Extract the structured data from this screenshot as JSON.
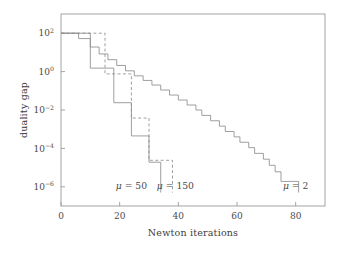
{
  "chart_data": {
    "type": "line",
    "title": "",
    "xlabel": "Newton iterations",
    "ylabel": "duality gap",
    "xlim": [
      0,
      90
    ],
    "ylim_log10": [
      -7,
      3
    ],
    "yscale": "log",
    "grid": false,
    "legend_position": "inline-annotations",
    "xticks": [
      0,
      20,
      40,
      60,
      80
    ],
    "xtick_labels": [
      "0",
      "20",
      "40",
      "60",
      "80"
    ],
    "yticks_log10": [
      2,
      0,
      -2,
      -4,
      -6
    ],
    "ytick_mantissa": [
      "10",
      "10",
      "10",
      "10",
      "10"
    ],
    "ytick_exponents": [
      "2",
      "0",
      "−2",
      "−4",
      "−6"
    ],
    "annotations": [
      {
        "text_mu": "μ",
        "text_rest": " = 50",
        "x": 24,
        "y_log10": -6.1
      },
      {
        "text_mu": "μ",
        "text_rest": " = 150",
        "x": 39,
        "y_log10": -6.1
      },
      {
        "text_mu": "μ",
        "text_rest": " = 2",
        "x": 80,
        "y_log10": -6.1
      }
    ],
    "series": [
      {
        "name": "mu = 50",
        "mu": 50,
        "style": "solid",
        "color": "#8e8e8e",
        "points_log10": [
          [
            0,
            2.0
          ],
          [
            6,
            2.0
          ],
          [
            6,
            1.72
          ],
          [
            10,
            1.72
          ],
          [
            10,
            0.18
          ],
          [
            14,
            0.18
          ],
          [
            14,
            0.18
          ],
          [
            18,
            0.18
          ],
          [
            18,
            -1.62
          ],
          [
            24,
            -1.62
          ],
          [
            24,
            -3.35
          ],
          [
            30,
            -3.35
          ],
          [
            30,
            -4.72
          ],
          [
            34,
            -4.72
          ],
          [
            34,
            -6.3
          ]
        ]
      },
      {
        "name": "mu = 150",
        "mu": 150,
        "style": "dashed",
        "color": "#8e8e8e",
        "points_log10": [
          [
            0,
            2.0
          ],
          [
            15,
            2.0
          ],
          [
            15,
            -0.12
          ],
          [
            24,
            -0.12
          ],
          [
            24,
            -2.42
          ],
          [
            30,
            -2.42
          ],
          [
            30,
            -4.62
          ],
          [
            38,
            -4.62
          ],
          [
            38,
            -6.3
          ]
        ]
      },
      {
        "name": "mu = 2",
        "mu": 2,
        "style": "solid",
        "color": "#8e8e8e",
        "points_log10": [
          [
            0,
            2.0
          ],
          [
            10,
            2.0
          ],
          [
            10,
            1.28
          ],
          [
            13,
            1.28
          ],
          [
            13,
            0.92
          ],
          [
            16,
            0.92
          ],
          [
            16,
            0.62
          ],
          [
            19,
            0.62
          ],
          [
            19,
            0.32
          ],
          [
            22,
            0.32
          ],
          [
            22,
            0.04
          ],
          [
            25,
            0.04
          ],
          [
            25,
            -0.22
          ],
          [
            28,
            -0.22
          ],
          [
            28,
            -0.46
          ],
          [
            31,
            -0.46
          ],
          [
            31,
            -0.7
          ],
          [
            34,
            -0.7
          ],
          [
            34,
            -0.96
          ],
          [
            37,
            -0.96
          ],
          [
            37,
            -1.22
          ],
          [
            40,
            -1.22
          ],
          [
            40,
            -1.48
          ],
          [
            43,
            -1.48
          ],
          [
            43,
            -1.74
          ],
          [
            46,
            -1.74
          ],
          [
            46,
            -2.0
          ],
          [
            48,
            -2.0
          ],
          [
            48,
            -2.28
          ],
          [
            51,
            -2.28
          ],
          [
            51,
            -2.56
          ],
          [
            54,
            -2.56
          ],
          [
            54,
            -2.84
          ],
          [
            56,
            -2.84
          ],
          [
            56,
            -3.12
          ],
          [
            59,
            -3.12
          ],
          [
            59,
            -3.4
          ],
          [
            61,
            -3.4
          ],
          [
            61,
            -3.68
          ],
          [
            64,
            -3.68
          ],
          [
            64,
            -3.96
          ],
          [
            66,
            -3.96
          ],
          [
            66,
            -4.26
          ],
          [
            69,
            -4.26
          ],
          [
            69,
            -4.56
          ],
          [
            71,
            -4.56
          ],
          [
            71,
            -4.88
          ],
          [
            73,
            -4.88
          ],
          [
            73,
            -5.22
          ],
          [
            75,
            -5.22
          ],
          [
            75,
            -5.72
          ],
          [
            81,
            -5.72
          ],
          [
            81,
            -6.3
          ]
        ]
      }
    ]
  },
  "axes_geometry": {
    "plot_left_px": 61,
    "plot_right_px": 325,
    "plot_top_px": 14,
    "plot_bottom_px": 206
  }
}
